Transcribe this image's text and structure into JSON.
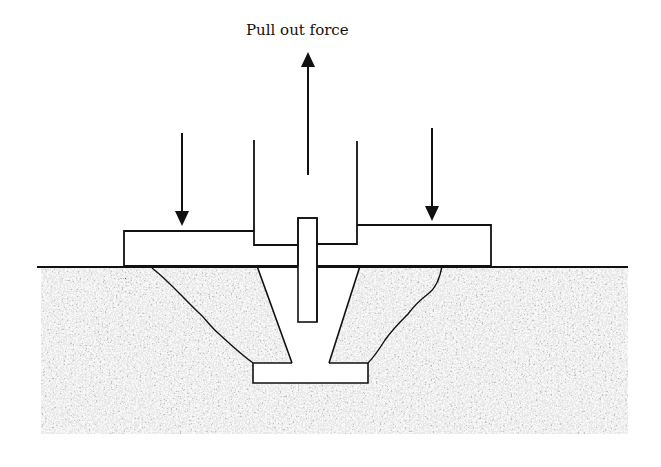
{
  "diagram": {
    "title_label": "Pull out force",
    "colors": {
      "line": "#111111",
      "concrete_base": "#d9d9d9",
      "concrete_speckle": "#1a1a1a",
      "background": "#ffffff"
    },
    "elements": {
      "pull_arrow": {
        "direction": "up",
        "x": 308,
        "y_tail": 175,
        "y_head": 52
      },
      "left_reaction_arrow": {
        "direction": "down",
        "x": 182,
        "y_tail": 133,
        "y_head": 226
      },
      "right_reaction_arrow": {
        "direction": "down",
        "x": 432,
        "y_tail": 128,
        "y_head": 221
      },
      "ground_line": {
        "x1": 37,
        "x2": 628,
        "y": 267
      },
      "concrete_block": {
        "x": 41,
        "y": 268,
        "width": 587,
        "height": 166
      }
    }
  }
}
